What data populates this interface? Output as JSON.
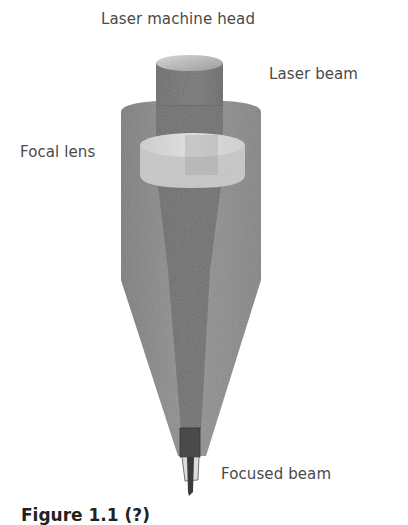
{
  "diagram": {
    "labels": {
      "head": "Laser machine head",
      "beam": "Laser beam",
      "lens": "Focal lens",
      "focused": "Focused beam"
    },
    "caption": "Figure 1.1 (?)",
    "components": [
      "laser-machine-head",
      "laser-beam",
      "focal-lens",
      "conical-nozzle-body",
      "focused-beam"
    ],
    "colors": {
      "body": "#8a8a8a",
      "beam": "#6a6a6a",
      "lens": "#d6d6d6",
      "head_top": "#b8b8b8",
      "text": "#4a4a4a"
    }
  }
}
